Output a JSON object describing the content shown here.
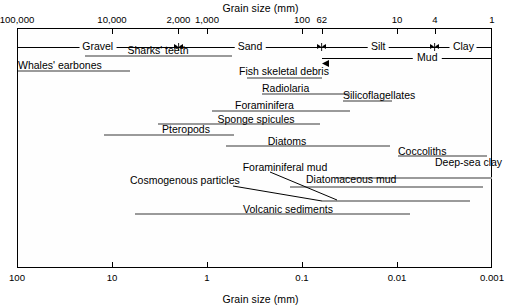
{
  "figure": {
    "top_axis_title": "Grain size (mm)",
    "bottom_axis_title": "Grain size (mm)",
    "bar_color": "#9a9a9a",
    "frame_color": "#000000"
  },
  "top_scale": {
    "unit": "micrometers",
    "ticks": [
      {
        "label": "100,000",
        "mm": 100
      },
      {
        "label": "10,000",
        "mm": 10
      },
      {
        "label": "2,000",
        "mm": 2
      },
      {
        "label": "1,000",
        "mm": 1
      },
      {
        "label": "100",
        "mm": 0.1
      },
      {
        "label": "62",
        "mm": 0.062
      },
      {
        "label": "10",
        "mm": 0.01
      },
      {
        "label": "4",
        "mm": 0.004
      },
      {
        "label": "1",
        "mm": 0.001
      }
    ]
  },
  "bottom_scale": {
    "unit": "millimeters",
    "ticks": [
      {
        "label": "100",
        "mm": 100
      },
      {
        "label": "10",
        "mm": 10
      },
      {
        "label": "1",
        "mm": 1
      },
      {
        "label": "0.1",
        "mm": 0.1
      },
      {
        "label": "0.01",
        "mm": 0.01
      },
      {
        "label": "0.001",
        "mm": 0.001
      }
    ]
  },
  "size_classes": [
    {
      "label": "Gravel",
      "from_mm": 100,
      "to_mm": 2
    },
    {
      "label": "Sand",
      "from_mm": 2,
      "to_mm": 0.062
    },
    {
      "label": "Silt",
      "from_mm": 0.062,
      "to_mm": 0.004
    },
    {
      "label": "Clay",
      "from_mm": 0.004,
      "to_mm": 0.001
    }
  ],
  "class_boundaries_mm": [
    2,
    0.062,
    0.004
  ],
  "mud_bracket": {
    "label": "Mud",
    "from_mm": 0.062,
    "to_mm": 0.001
  },
  "chart_data": {
    "type": "bar",
    "title": "Grain size (mm)",
    "xlabel": "Grain size (mm)",
    "ylabel": "",
    "scale": "log",
    "xlim": [
      100,
      0.001
    ],
    "grid": false,
    "legend": null,
    "note": "Horizontal range bars showing the grain-size span of marine sediment components; x axis is logarithmic in mm, decreasing left to right.",
    "categories": [
      "Sharks' teeth",
      "Whales' earbones",
      "Fish skeletal debris",
      "Radiolaria",
      "Silicoflagellates",
      "Foraminifera",
      "Sponge spicules",
      "Pteropods",
      "Diatoms",
      "Coccoliths",
      "Foraminiferal mud",
      "Deep-sea clay",
      "Diatomaceous mud",
      "Cosmogenous particles",
      "Volcanic sediments"
    ],
    "ranges_mm": [
      {
        "name": "Sharks' teeth",
        "from_mm": 21.0,
        "to_mm": 0.62
      },
      {
        "name": "Whales' earbones",
        "from_mm": 100.0,
        "to_mm": 6.8
      },
      {
        "name": "Fish skeletal debris",
        "from_mm": 0.45,
        "to_mm": 0.062
      },
      {
        "name": "Radiolaria",
        "from_mm": 0.34,
        "to_mm": 0.012
      },
      {
        "name": "Silicoflagellates",
        "from_mm": 0.014,
        "to_mm": 0.0044
      },
      {
        "name": "Foraminifera",
        "from_mm": 1.15,
        "to_mm": 0.012
      },
      {
        "name": "Sponge spicules",
        "from_mm": 2.6,
        "to_mm": 0.031
      },
      {
        "name": "Pteropods",
        "from_mm": 12.0,
        "to_mm": 0.52
      },
      {
        "name": "Diatoms",
        "from_mm": 0.62,
        "to_mm": 0.0046
      },
      {
        "name": "Coccoliths",
        "from_mm": 0.011,
        "to_mm": 0.0013
      },
      {
        "name": "Foraminiferal mud",
        "from_mm": 0.056,
        "to_mm": 0.0012
      },
      {
        "name": "Deep-sea clay",
        "from_mm": 0.0055,
        "to_mm": 0.001
      },
      {
        "name": "Diatomaceous mud",
        "from_mm": 0.115,
        "to_mm": 0.0019
      },
      {
        "name": "Cosmogenous particles",
        "from_mm": 0.062,
        "to_mm": 0.0026
      },
      {
        "name": "Volcanic sediments",
        "from_mm": 6.0,
        "to_mm": 0.0035
      }
    ]
  },
  "bars": [
    {
      "id": "sharks-teeth",
      "label": "Sharks' teeth",
      "x1": 85,
      "x2": 232,
      "y": 55,
      "label_x": 158,
      "label_y": 44,
      "align": "center"
    },
    {
      "id": "whales-earbones",
      "label": "Whales' earbones",
      "x1": 18,
      "x2": 130,
      "y": 70,
      "label_x": 18,
      "label_y": 59,
      "align": "left"
    },
    {
      "id": "fish-skeletal-debris",
      "label": "Fish skeletal debris",
      "x1": 247,
      "x2": 322,
      "y": 77,
      "label_x": 284,
      "label_y": 65,
      "align": "center"
    },
    {
      "id": "radiolaria",
      "label": "Radiolaria",
      "x1": 262,
      "x2": 350,
      "y": 93,
      "label_x": 262,
      "label_y": 82,
      "align": "left"
    },
    {
      "id": "silicoflagellates",
      "label": "Silicoflagellates",
      "x1": 343,
      "x2": 392,
      "y": 100,
      "label_x": 343,
      "label_y": 89,
      "align": "left"
    },
    {
      "id": "foraminifera",
      "label": "Foraminifera",
      "x1": 212,
      "x2": 350,
      "y": 110,
      "label_x": 235,
      "label_y": 99,
      "align": "left"
    },
    {
      "id": "sponge-spicules",
      "label": "Sponge spicules",
      "x1": 158,
      "x2": 320,
      "y": 123,
      "label_x": 256,
      "label_y": 113,
      "align": "center"
    },
    {
      "id": "pteropods",
      "label": "Pteropods",
      "x1": 104,
      "x2": 234,
      "y": 134,
      "label_x": 186,
      "label_y": 123,
      "align": "center"
    },
    {
      "id": "diatoms",
      "label": "Diatoms",
      "x1": 226,
      "x2": 390,
      "y": 145,
      "label_x": 287,
      "label_y": 135,
      "align": "center"
    },
    {
      "id": "coccoliths",
      "label": "Coccoliths",
      "x1": 398,
      "x2": 487,
      "y": 155,
      "label_x": 398,
      "label_y": 145,
      "align": "left"
    },
    {
      "id": "foraminiferal-mud",
      "label": "Foraminiferal mud",
      "x1": 336,
      "x2": 492,
      "y": 177,
      "label_x": 285,
      "label_y": 161,
      "align": "center"
    },
    {
      "id": "deep-sea-clay",
      "label": "Deep-sea clay",
      "x1": 452,
      "x2": 492,
      "y": 177,
      "label_x": 435,
      "label_y": 156,
      "align": "left"
    },
    {
      "id": "diatomaceous-mud",
      "label": "Diatomaceous mud",
      "x1": 290,
      "x2": 483,
      "y": 186,
      "label_x": 306,
      "label_y": 173,
      "align": "left"
    },
    {
      "id": "cosmogenous-particles",
      "label": "Cosmogenous particles",
      "x1": 322,
      "x2": 470,
      "y": 200,
      "label_x": 130,
      "label_y": 174,
      "align": "left"
    },
    {
      "id": "volcanic-sediments",
      "label": "Volcanic sediments",
      "x1": 135,
      "x2": 410,
      "y": 213,
      "label_x": 288,
      "label_y": 203,
      "align": "center"
    }
  ],
  "leaders": [
    {
      "id": "leader-cosmogenous",
      "x1": 233,
      "y1": 186,
      "x2": 322,
      "y2": 201
    },
    {
      "id": "leader-foraminiferal-mud",
      "x1": 270,
      "y1": 172,
      "x2": 337,
      "y2": 200
    }
  ]
}
